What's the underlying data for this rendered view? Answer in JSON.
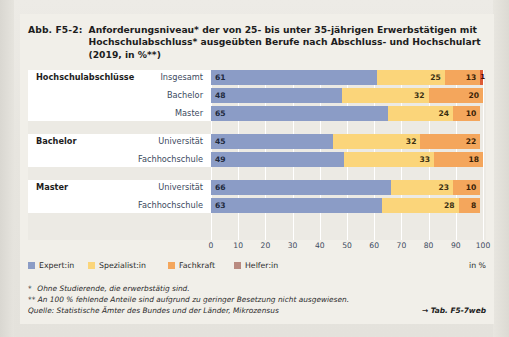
{
  "figure": {
    "tag": "Abb. F5-2:",
    "title_lines": [
      "Anforderungsniveau* der von 25- bis unter 35-jährigen Erwerbstätigen mit",
      "Hochschulabschluss* ausgeübten Berufe nach Abschluss- und Hochschulart",
      "(2019, in %**)"
    ]
  },
  "legend": {
    "items": [
      {
        "label": "Expert:in",
        "color": "#8b9cc6",
        "key": "expert"
      },
      {
        "label": "Spezialist:in",
        "color": "#fbd57a",
        "key": "spezialist"
      },
      {
        "label": "Fachkraft",
        "color": "#f4a65c",
        "key": "fachkraft"
      },
      {
        "label": "Helfer:in",
        "color": "#b98a80",
        "key": "helfer"
      }
    ],
    "unit": "in %"
  },
  "axis": {
    "ticks": [
      "0",
      "10",
      "20",
      "30",
      "40",
      "50",
      "60",
      "70",
      "80",
      "90",
      "100"
    ]
  },
  "groups": [
    {
      "label": "Hochschulabschlüsse",
      "rows": [
        {
          "label": "Insgesamt",
          "values": [
            "61",
            "25",
            "13",
            "1"
          ]
        },
        {
          "label": "Bachelor",
          "values": [
            "48",
            "32",
            "20",
            ""
          ]
        },
        {
          "label": "Master",
          "values": [
            "65",
            "24",
            "10",
            ""
          ]
        }
      ]
    },
    {
      "label": "Bachelor",
      "rows": [
        {
          "label": "Universität",
          "values": [
            "45",
            "32",
            "22",
            ""
          ]
        },
        {
          "label": "Fachhochschule",
          "values": [
            "49",
            "33",
            "18",
            ""
          ]
        }
      ]
    },
    {
      "label": "Master",
      "rows": [
        {
          "label": "Universität",
          "values": [
            "66",
            "23",
            "10",
            ""
          ]
        },
        {
          "label": "Fachhochschule",
          "values": [
            "63",
            "28",
            "8",
            ""
          ]
        }
      ]
    }
  ],
  "notes": {
    "note1_marker": "*",
    "note1": "Ohne Studierende, die erwerbstätig sind.",
    "note2_marker": "**",
    "note2": "An 100 % fehlende Anteile sind aufgrund zu geringer Besetzung nicht ausgewiesen.",
    "source": "Quelle: Statistische Ämter des Bundes und der Länder, Mikrozensus",
    "reference": "→ Tab. F5-7web"
  },
  "chart_data": {
    "type": "bar",
    "orientation": "horizontal",
    "stacked": true,
    "title": "Anforderungsniveau* der von 25- bis unter 35-jährigen Erwerbstätigen mit Hochschulabschluss* ausgeübten Berufe nach Abschluss- und Hochschulart (2019, in %**)",
    "xlabel": "in %",
    "ylabel": "",
    "xlim": [
      0,
      100
    ],
    "xticks": [
      0,
      10,
      20,
      30,
      40,
      50,
      60,
      70,
      80,
      90,
      100
    ],
    "grid": "vertical",
    "legend_position": "bottom-left",
    "series": [
      {
        "name": "Expert:in",
        "color": "#8b9cc6",
        "values": [
          61,
          48,
          65,
          45,
          49,
          66,
          63
        ]
      },
      {
        "name": "Spezialist:in",
        "color": "#fbd57a",
        "values": [
          25,
          32,
          24,
          32,
          33,
          23,
          28
        ]
      },
      {
        "name": "Fachkraft",
        "color": "#f4a65c",
        "values": [
          13,
          20,
          10,
          22,
          18,
          10,
          8
        ]
      },
      {
        "name": "Helfer:in",
        "color": "#dd5b35",
        "values": [
          1,
          null,
          null,
          null,
          null,
          null,
          null
        ]
      }
    ],
    "categories": [
      "Hochschulabschlüsse – Insgesamt",
      "Hochschulabschlüsse – Bachelor",
      "Hochschulabschlüsse – Master",
      "Bachelor – Universität",
      "Bachelor – Fachhochschule",
      "Master – Universität",
      "Master – Fachhochschule"
    ],
    "groups": [
      {
        "name": "Hochschulabschlüsse",
        "categories": [
          "Insgesamt",
          "Bachelor",
          "Master"
        ]
      },
      {
        "name": "Bachelor",
        "categories": [
          "Universität",
          "Fachhochschule"
        ]
      },
      {
        "name": "Master",
        "categories": [
          "Universität",
          "Fachhochschule"
        ]
      }
    ]
  }
}
